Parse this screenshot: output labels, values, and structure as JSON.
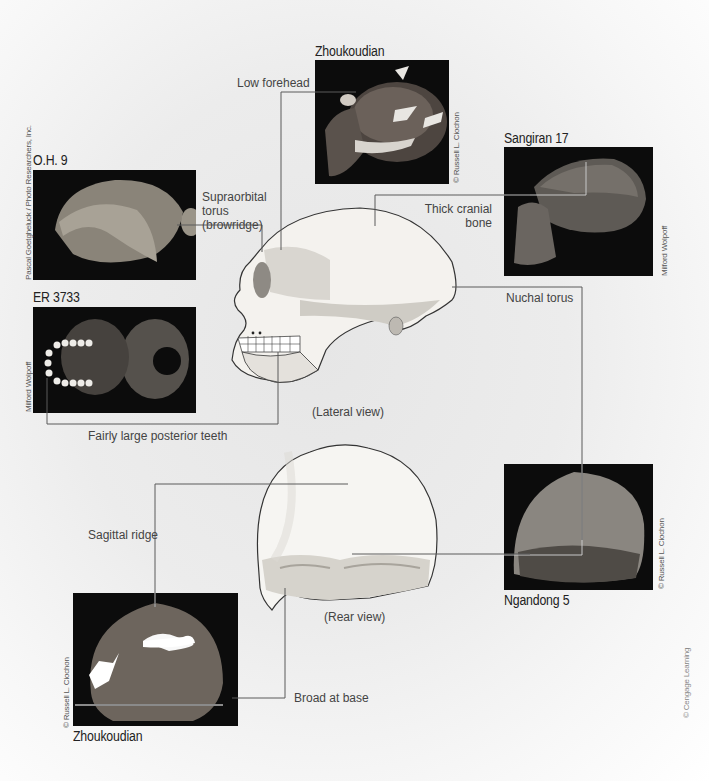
{
  "specimens": {
    "zhoukoudian_lateral": {
      "name": "Zhoukoudian",
      "credit": "© Russell L. Ciochon"
    },
    "sangiran_17": {
      "name": "Sangiran 17",
      "credit": "Milford Wolpoff"
    },
    "oh_9": {
      "name": "O.H. 9",
      "credit": "Pascal Goetgheluck / Photo Researchers, Inc."
    },
    "er_3733": {
      "name": "ER 3733",
      "credit": "Milford Wolpoff"
    },
    "ngandong_5": {
      "name": "Ngandong 5",
      "credit": "© Russell L. Ciochon"
    },
    "zhoukoudian_rear": {
      "name": "Zhoukoudian",
      "credit": "© Russell L. Ciochon"
    }
  },
  "features": {
    "low_forehead": "Low forehead",
    "supraorbital_line1": "Supraorbital",
    "supraorbital_line2": "torus",
    "supraorbital_line3": "(browridge)",
    "thick_cranial_line1": "Thick cranial",
    "thick_cranial_line2": "bone",
    "nuchal_torus": "Nuchal torus",
    "posterior_teeth": "Fairly large posterior teeth",
    "sagittal_ridge": "Sagittal ridge",
    "broad_at_base": "Broad at base"
  },
  "views": {
    "lateral": "(Lateral view)",
    "rear": "(Rear view)"
  },
  "publisher_credit": "© Cengage Learning",
  "colors": {
    "photo_bg": "#0c0c0c",
    "leader_line": "#5a5a5a",
    "bone": "#f4f2ee",
    "bone_shadow": "#b9b6b0"
  }
}
